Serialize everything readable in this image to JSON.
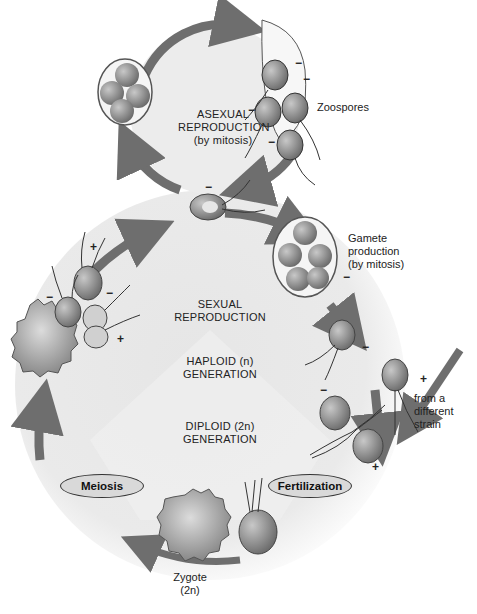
{
  "diagram": {
    "asexual": {
      "title_line1": "ASEXUAL",
      "title_line2": "REPRODUCTION",
      "title_line3": "(by mitosis)",
      "zoospores_label": "Zoospores"
    },
    "sexual": {
      "title_line1": "SEXUAL",
      "title_line2": "REPRODUCTION",
      "haploid_line1": "HAPLOID (n)",
      "haploid_line2": "GENERATION",
      "diploid_line1": "DIPLOID (2n)",
      "diploid_line2": "GENERATION",
      "gamete_line1": "Gamete",
      "gamete_line2": "production",
      "gamete_line3": "(by mitosis)",
      "strain_line1": "from a",
      "strain_line2": "different",
      "strain_line3": "strain",
      "fertilization": "Fertilization",
      "meiosis": "Meiosis",
      "zygote_line1": "Zygote",
      "zygote_line2": "(2n)"
    },
    "signs": {
      "minus": "−",
      "plus": "+"
    },
    "colors": {
      "arrow": "#6e6e6e",
      "cell_fill": "#9a9a9a",
      "cell_inner": "#e0e0e0",
      "background_haploid": "#e4e4e4",
      "background_diploid": "#efefef"
    }
  }
}
